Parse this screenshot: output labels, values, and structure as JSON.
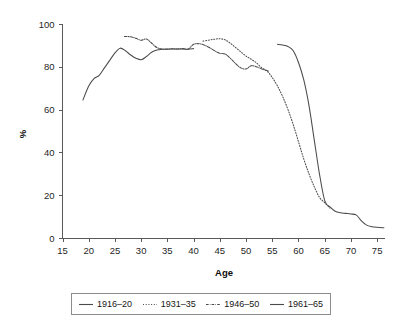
{
  "chart_data": {
    "type": "line",
    "title": "",
    "xlabel": "Age",
    "ylabel": "%",
    "xlim": [
      15,
      76.5
    ],
    "ylim": [
      0,
      100
    ],
    "x_ticks": [
      15,
      20,
      25,
      30,
      35,
      40,
      45,
      50,
      55,
      60,
      65,
      70,
      75
    ],
    "y_ticks": [
      0,
      20,
      40,
      60,
      80,
      100
    ],
    "grid": false,
    "legend_position": "bottom",
    "line_color": "#4a4a4a",
    "series": [
      {
        "name": "1916-20",
        "label": "1916–20",
        "style": "solid",
        "x": [
          56,
          57,
          58,
          59,
          60,
          61,
          62,
          63,
          64,
          65,
          66,
          67,
          68,
          69,
          70,
          71,
          72,
          73,
          74,
          75,
          76.3
        ],
        "values": [
          90.5,
          90.2,
          89.5,
          87.5,
          82.0,
          74.0,
          62.0,
          46.0,
          30.0,
          17.5,
          14.5,
          12.5,
          11.8,
          11.5,
          11.2,
          10.8,
          8.0,
          6.0,
          5.3,
          5.0,
          4.8
        ]
      },
      {
        "name": "1931-35",
        "label": "1931–35",
        "style": "dotted",
        "x": [
          41.8,
          43,
          44,
          45,
          46,
          47,
          48,
          49,
          50,
          51,
          52,
          53,
          54,
          55,
          56,
          57,
          58,
          59,
          60,
          61,
          62,
          63,
          64,
          65,
          66
        ],
        "values": [
          92.0,
          92.5,
          92.9,
          93.1,
          92.6,
          91.0,
          89.0,
          87.0,
          85.0,
          83.5,
          81.8,
          79.5,
          78.0,
          75.0,
          71.0,
          66.0,
          60.0,
          53.0,
          45.0,
          37.0,
          30.0,
          24.0,
          19.0,
          16.5,
          14.0
        ]
      },
      {
        "name": "1946-50",
        "label": "1946–50",
        "style": "dashdot",
        "x": [
          26.8,
          28,
          29,
          30,
          31,
          32,
          33,
          34,
          35,
          36,
          37,
          38,
          39,
          40,
          41,
          42,
          43,
          44,
          45,
          46,
          47,
          48,
          49,
          50,
          51,
          52,
          53,
          54.3
        ],
        "values": [
          94.2,
          94.0,
          93.3,
          92.4,
          93.0,
          91.0,
          89.0,
          88.3,
          88.2,
          88.4,
          88.3,
          88.5,
          88.3,
          90.5,
          90.8,
          90.2,
          89.0,
          87.5,
          86.3,
          86.0,
          84.0,
          81.5,
          79.5,
          79.0,
          80.5,
          80.0,
          79.0,
          78.0
        ]
      },
      {
        "name": "1961-65",
        "label": "1961–65",
        "style": "solid",
        "x": [
          18.9,
          20,
          21,
          22,
          23,
          24,
          25,
          26,
          27,
          28,
          29,
          30,
          31,
          32,
          33,
          34,
          35,
          36,
          37,
          38,
          39,
          40
        ],
        "values": [
          64.5,
          71.0,
          74.5,
          76.0,
          79.5,
          83.0,
          86.5,
          88.7,
          87.5,
          85.5,
          84.0,
          83.3,
          84.8,
          86.8,
          87.8,
          88.2,
          88.3,
          88.3,
          88.3,
          88.3,
          88.2,
          88.5
        ]
      }
    ],
    "legend_entries": [
      {
        "label": "1916–20",
        "style": "solid"
      },
      {
        "label": "1931–35",
        "style": "dotted"
      },
      {
        "label": "1946–50",
        "style": "dashdot"
      },
      {
        "label": "1961–65",
        "style": "solid"
      }
    ]
  }
}
